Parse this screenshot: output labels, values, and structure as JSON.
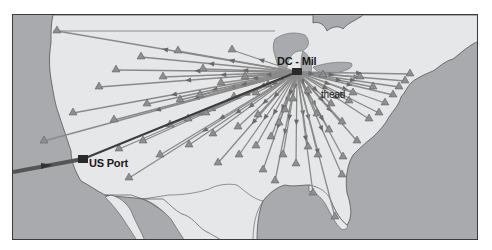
{
  "map": {
    "type": "distribution-network",
    "region": "Continental United States",
    "colors": {
      "water": "#a9aaad",
      "land": "#e6e7e9",
      "border_line": "#555555",
      "route_line": "#8a8a8a",
      "import_route": "#3c3c3c",
      "marker": "#8e8e8e",
      "frame": "#3a3a3a"
    },
    "labels": {
      "dc": "DC - Mil",
      "port": "US Port",
      "hub": "thead"
    },
    "dc_location": {
      "x": 284,
      "y": 57
    },
    "port_location": {
      "x": 70,
      "y": 144
    },
    "import_route": {
      "from": {
        "x": 0,
        "y": 157
      },
      "to": {
        "x": 70,
        "y": 144
      }
    },
    "port_to_dc_route": {
      "from": {
        "x": 70,
        "y": 144
      },
      "to": {
        "x": 284,
        "y": 57
      }
    },
    "customers": [
      {
        "x": 44,
        "y": 16
      },
      {
        "x": 86,
        "y": 72
      },
      {
        "x": 103,
        "y": 55
      },
      {
        "x": 128,
        "y": 42
      },
      {
        "x": 150,
        "y": 62
      },
      {
        "x": 165,
        "y": 36
      },
      {
        "x": 219,
        "y": 35
      },
      {
        "x": 190,
        "y": 54
      },
      {
        "x": 60,
        "y": 98
      },
      {
        "x": 101,
        "y": 105
      },
      {
        "x": 134,
        "y": 89
      },
      {
        "x": 167,
        "y": 85
      },
      {
        "x": 187,
        "y": 80
      },
      {
        "x": 208,
        "y": 68
      },
      {
        "x": 232,
        "y": 62
      },
      {
        "x": 31,
        "y": 126
      },
      {
        "x": 106,
        "y": 134
      },
      {
        "x": 130,
        "y": 126
      },
      {
        "x": 157,
        "y": 110
      },
      {
        "x": 175,
        "y": 104
      },
      {
        "x": 193,
        "y": 98
      },
      {
        "x": 221,
        "y": 82
      },
      {
        "x": 243,
        "y": 78
      },
      {
        "x": 255,
        "y": 70
      },
      {
        "x": 116,
        "y": 163
      },
      {
        "x": 147,
        "y": 140
      },
      {
        "x": 176,
        "y": 130
      },
      {
        "x": 200,
        "y": 119
      },
      {
        "x": 205,
        "y": 148
      },
      {
        "x": 226,
        "y": 140
      },
      {
        "x": 243,
        "y": 131
      },
      {
        "x": 258,
        "y": 122
      },
      {
        "x": 266,
        "y": 108
      },
      {
        "x": 262,
        "y": 166
      },
      {
        "x": 250,
        "y": 155
      },
      {
        "x": 283,
        "y": 149
      },
      {
        "x": 295,
        "y": 132
      },
      {
        "x": 305,
        "y": 140
      },
      {
        "x": 316,
        "y": 115
      },
      {
        "x": 330,
        "y": 142
      },
      {
        "x": 344,
        "y": 126
      },
      {
        "x": 356,
        "y": 104
      },
      {
        "x": 366,
        "y": 98
      },
      {
        "x": 372,
        "y": 88
      },
      {
        "x": 380,
        "y": 80
      },
      {
        "x": 386,
        "y": 72
      },
      {
        "x": 392,
        "y": 66
      },
      {
        "x": 397,
        "y": 59
      },
      {
        "x": 304,
        "y": 99
      },
      {
        "x": 336,
        "y": 86
      },
      {
        "x": 329,
        "y": 107
      },
      {
        "x": 318,
        "y": 89
      },
      {
        "x": 347,
        "y": 62
      },
      {
        "x": 360,
        "y": 72
      },
      {
        "x": 340,
        "y": 78
      },
      {
        "x": 310,
        "y": 60
      },
      {
        "x": 295,
        "y": 76
      },
      {
        "x": 280,
        "y": 84
      },
      {
        "x": 272,
        "y": 95
      },
      {
        "x": 322,
        "y": 202
      },
      {
        "x": 329,
        "y": 160
      },
      {
        "x": 300,
        "y": 178
      },
      {
        "x": 270,
        "y": 140
      },
      {
        "x": 225,
        "y": 112
      },
      {
        "x": 245,
        "y": 100
      }
    ]
  }
}
